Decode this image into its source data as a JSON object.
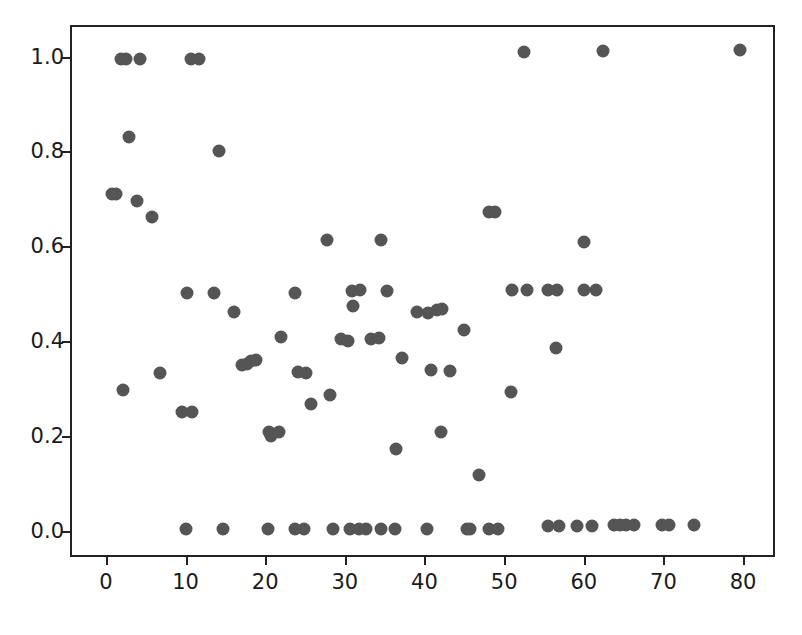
{
  "chart_data": {
    "type": "scatter",
    "title": "",
    "xlabel": "",
    "ylabel": "",
    "xlim": [
      -4.5,
      84.0
    ],
    "ylim": [
      -0.055,
      1.0665
    ],
    "grid": false,
    "legend": null,
    "marker": {
      "color": "#555555",
      "shape": "circle",
      "size_px": 13
    },
    "xticks": [
      0,
      10,
      20,
      30,
      40,
      50,
      60,
      70,
      80
    ],
    "xticklabels": [
      "0",
      "10",
      "20",
      "30",
      "40",
      "50",
      "60",
      "70",
      "80"
    ],
    "yticks": [
      0.0,
      0.2,
      0.4,
      0.6,
      0.8,
      1.0
    ],
    "yticklabels": [
      "0.0",
      "0.2",
      "0.4",
      "0.6",
      "0.8",
      "1.0"
    ],
    "n_points": 91,
    "points": [
      [
        1.6,
        1.0
      ],
      [
        2.3,
        1.0
      ],
      [
        4.0,
        1.0
      ],
      [
        10.5,
        1.0
      ],
      [
        11.4,
        1.0
      ],
      [
        52.3,
        1.013
      ],
      [
        62.1,
        1.015
      ],
      [
        79.3,
        1.017
      ],
      [
        2.6,
        0.835
      ],
      [
        13.9,
        0.805
      ],
      [
        0.5,
        0.715
      ],
      [
        1.0,
        0.715
      ],
      [
        3.6,
        0.7
      ],
      [
        5.5,
        0.667
      ],
      [
        47.8,
        0.677
      ],
      [
        48.6,
        0.677
      ],
      [
        27.5,
        0.618
      ],
      [
        34.3,
        0.618
      ],
      [
        59.8,
        0.613
      ],
      [
        9.9,
        0.505
      ],
      [
        13.3,
        0.505
      ],
      [
        23.5,
        0.506
      ],
      [
        30.6,
        0.51
      ],
      [
        31.7,
        0.512
      ],
      [
        35.0,
        0.51
      ],
      [
        50.7,
        0.513
      ],
      [
        52.6,
        0.513
      ],
      [
        55.2,
        0.513
      ],
      [
        56.4,
        0.513
      ],
      [
        59.8,
        0.513
      ],
      [
        61.3,
        0.513
      ],
      [
        30.8,
        0.478
      ],
      [
        38.8,
        0.465
      ],
      [
        40.2,
        0.463
      ],
      [
        41.3,
        0.47
      ],
      [
        42.0,
        0.472
      ],
      [
        15.8,
        0.465
      ],
      [
        44.7,
        0.427
      ],
      [
        21.7,
        0.413
      ],
      [
        29.3,
        0.408
      ],
      [
        30.2,
        0.405
      ],
      [
        33.0,
        0.408
      ],
      [
        34.0,
        0.41
      ],
      [
        16.9,
        0.355
      ],
      [
        17.5,
        0.357
      ],
      [
        18.6,
        0.365
      ],
      [
        18.0,
        0.362
      ],
      [
        23.9,
        0.34
      ],
      [
        24.9,
        0.337
      ],
      [
        36.9,
        0.368
      ],
      [
        40.6,
        0.343
      ],
      [
        43.0,
        0.342
      ],
      [
        56.2,
        0.39
      ],
      [
        6.6,
        0.337
      ],
      [
        1.9,
        0.302
      ],
      [
        27.9,
        0.29
      ],
      [
        25.5,
        0.271
      ],
      [
        50.6,
        0.298
      ],
      [
        9.3,
        0.254
      ],
      [
        10.6,
        0.255
      ],
      [
        20.2,
        0.212
      ],
      [
        20.5,
        0.205
      ],
      [
        21.5,
        0.213
      ],
      [
        41.8,
        0.212
      ],
      [
        36.2,
        0.177
      ],
      [
        46.6,
        0.122
      ],
      [
        9.8,
        0.008
      ],
      [
        14.4,
        0.008
      ],
      [
        20.1,
        0.008
      ],
      [
        23.5,
        0.009
      ],
      [
        24.6,
        0.009
      ],
      [
        28.3,
        0.009
      ],
      [
        30.4,
        0.009
      ],
      [
        34.3,
        0.009
      ],
      [
        36.1,
        0.009
      ],
      [
        40.1,
        0.009
      ],
      [
        45.1,
        0.009
      ],
      [
        45.5,
        0.009
      ],
      [
        55.3,
        0.015
      ],
      [
        56.6,
        0.015
      ],
      [
        58.9,
        0.015
      ],
      [
        60.8,
        0.015
      ],
      [
        63.5,
        0.016
      ],
      [
        64.3,
        0.016
      ],
      [
        65.1,
        0.016
      ],
      [
        66.1,
        0.016
      ],
      [
        69.6,
        0.017
      ],
      [
        70.4,
        0.017
      ],
      [
        73.6,
        0.017
      ],
      [
        47.9,
        0.009
      ],
      [
        49.0,
        0.009
      ],
      [
        31.5,
        0.009
      ],
      [
        32.4,
        0.009
      ]
    ]
  },
  "axes": {
    "frame_color": "#222222",
    "background": "#ffffff"
  }
}
